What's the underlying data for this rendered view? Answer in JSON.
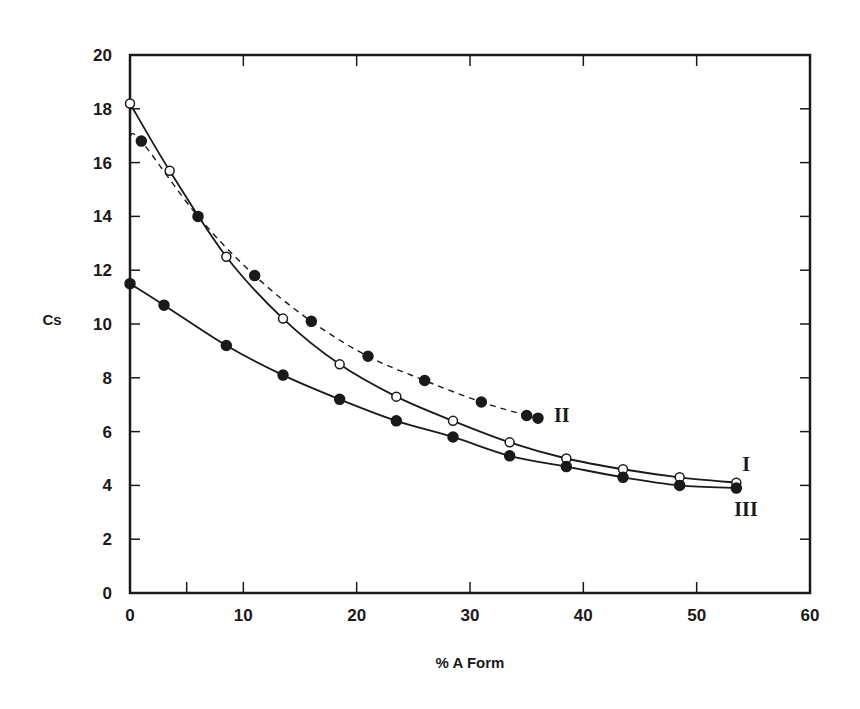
{
  "chart_data": {
    "type": "line",
    "title": "",
    "xlabel": "% A Form",
    "ylabel": "Cs",
    "xlim": [
      0,
      60
    ],
    "ylim": [
      0,
      20
    ],
    "xticks": [
      0,
      10,
      20,
      30,
      40,
      50,
      60
    ],
    "xminor_ticks": [
      5
    ],
    "yticks": [
      0,
      2,
      4,
      6,
      8,
      10,
      12,
      14,
      16,
      18,
      20
    ],
    "grid": false,
    "legend": "none (series labelled inline at curve ends)",
    "series": [
      {
        "name": "I",
        "marker": "open-circle",
        "line": "solid",
        "x": [
          0,
          3.5,
          8.5,
          13.5,
          18.5,
          23.5,
          28.5,
          33.5,
          38.5,
          43.5,
          48.5,
          53.5
        ],
        "y": [
          18.2,
          15.7,
          12.5,
          10.2,
          8.5,
          7.3,
          6.4,
          5.6,
          5.0,
          4.6,
          4.3,
          4.1
        ]
      },
      {
        "name": "II",
        "marker": "filled-circle",
        "line": "dashed",
        "x": [
          1,
          6,
          11,
          16,
          21,
          26,
          31,
          35,
          36
        ],
        "y": [
          16.8,
          14.0,
          11.8,
          10.1,
          8.8,
          7.9,
          7.1,
          6.6,
          6.5
        ],
        "line_start_y": 17.0
      },
      {
        "name": "III",
        "marker": "filled-circle",
        "line": "solid",
        "x": [
          0,
          3,
          8.5,
          13.5,
          18.5,
          23.5,
          28.5,
          33.5,
          38.5,
          43.5,
          48.5,
          53.5
        ],
        "y": [
          11.5,
          10.7,
          9.2,
          8.1,
          7.2,
          6.4,
          5.8,
          5.1,
          4.7,
          4.3,
          4.0,
          3.9
        ]
      }
    ]
  }
}
